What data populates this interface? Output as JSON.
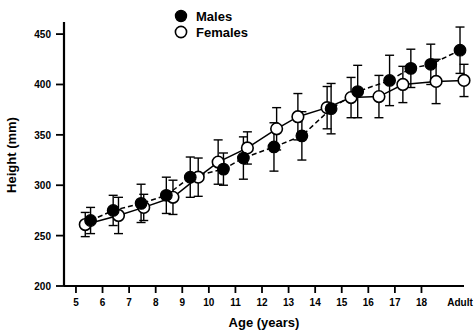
{
  "chart_data": {
    "type": "scatter",
    "title": "",
    "xlabel": "Age (years)",
    "ylabel": "Height (mm)",
    "xticklabels": [
      "5",
      "6",
      "7",
      "8",
      "9",
      "10",
      "11",
      "12",
      "13",
      "14",
      "15",
      "16",
      "17",
      "18",
      "Adult"
    ],
    "yticklabels": [
      "200",
      "250",
      "300",
      "350",
      "400",
      "450"
    ],
    "yticks": [
      200,
      250,
      300,
      350,
      400,
      450
    ],
    "ylim": [
      200,
      462
    ],
    "xlim": [
      4.55,
      19.6
    ],
    "grid": false,
    "legend_position": "top-center",
    "error_bars": "yes",
    "series": [
      {
        "name": "Males",
        "marker": "filled-circle",
        "line_style": "dashed",
        "x": [
          5.55,
          6.4,
          7.45,
          8.4,
          9.3,
          10.55,
          11.3,
          12.45,
          13.5,
          14.6,
          15.6,
          16.8,
          17.6,
          18.35,
          19.45
        ],
        "values": [
          265,
          275,
          282,
          290,
          308,
          316,
          327,
          338,
          349,
          376,
          393,
          404,
          416,
          420,
          434
        ],
        "errors": [
          13,
          15,
          19,
          18,
          20,
          16,
          21,
          24,
          24,
          25,
          26,
          25,
          19,
          20,
          23
        ]
      },
      {
        "name": "Females",
        "marker": "open-circle",
        "line_style": "solid",
        "x": [
          5.35,
          6.6,
          7.55,
          8.65,
          9.6,
          10.35,
          11.45,
          12.55,
          13.35,
          14.45,
          15.35,
          16.4,
          17.3,
          18.55,
          19.6
        ],
        "values": [
          261,
          270,
          278,
          288,
          308,
          323,
          337,
          356,
          368,
          377,
          387,
          388,
          400,
          403,
          404
        ],
        "errors": [
          12,
          18,
          13,
          17,
          19,
          22,
          16,
          21,
          23,
          21,
          20,
          21,
          18,
          22,
          16
        ]
      }
    ]
  },
  "legend": {
    "items": [
      {
        "label": "Males",
        "marker": "filled-circle"
      },
      {
        "label": "Females",
        "marker": "open-circle"
      }
    ]
  }
}
